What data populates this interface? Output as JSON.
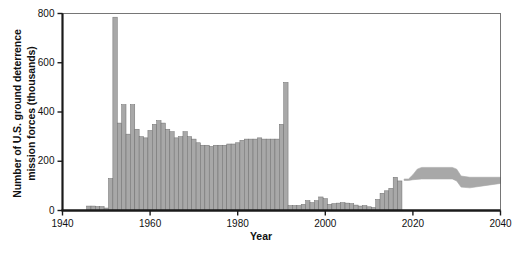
{
  "chart_data": {
    "type": "bar",
    "title": "",
    "xlabel": "Year",
    "ylabel": "Number of U.S. ground deterrence\nmission forces (thousands)",
    "xlim": [
      1940,
      2040
    ],
    "ylim": [
      0,
      800
    ],
    "xticks": [
      1940,
      1960,
      1980,
      2000,
      2020,
      2040
    ],
    "yticks": [
      0,
      200,
      400,
      600,
      800
    ],
    "grid": false,
    "legend": null,
    "bar_color": "#a8a8a8",
    "bar_edge_color": "#6e6e6e",
    "band_color": "#a8a8a8",
    "axis_color": "#1a1a1a",
    "categories": [
      1946,
      1947,
      1948,
      1949,
      1950,
      1951,
      1952,
      1953,
      1954,
      1955,
      1956,
      1957,
      1958,
      1959,
      1960,
      1961,
      1962,
      1963,
      1964,
      1965,
      1966,
      1967,
      1968,
      1969,
      1970,
      1971,
      1972,
      1973,
      1974,
      1975,
      1976,
      1977,
      1978,
      1979,
      1980,
      1981,
      1982,
      1983,
      1984,
      1985,
      1986,
      1987,
      1988,
      1989,
      1990,
      1991,
      1992,
      1993,
      1994,
      1995,
      1996,
      1997,
      1998,
      1999,
      2000,
      2001,
      2002,
      2003,
      2004,
      2005,
      2006,
      2007,
      2008,
      2009,
      2010,
      2011,
      2012,
      2013,
      2014,
      2015,
      2016,
      2017
    ],
    "values": [
      18,
      18,
      16,
      16,
      10,
      130,
      785,
      355,
      430,
      310,
      430,
      330,
      300,
      295,
      325,
      350,
      365,
      355,
      330,
      320,
      295,
      300,
      320,
      300,
      290,
      275,
      265,
      265,
      260,
      265,
      265,
      265,
      270,
      270,
      275,
      285,
      290,
      290,
      290,
      295,
      290,
      290,
      290,
      290,
      350,
      520,
      20,
      20,
      20,
      25,
      40,
      32,
      40,
      55,
      48,
      25,
      28,
      30,
      32,
      30,
      28,
      22,
      18,
      20,
      15,
      12,
      45,
      70,
      80,
      90,
      135,
      120
    ],
    "projection": {
      "label": "projection-band",
      "start_year": 2018,
      "end_year": 2040,
      "upper": [
        {
          "year": 2018,
          "value": 128
        },
        {
          "year": 2019,
          "value": 128
        },
        {
          "year": 2020,
          "value": 145
        },
        {
          "year": 2021,
          "value": 168
        },
        {
          "year": 2022,
          "value": 175
        },
        {
          "year": 2029,
          "value": 175
        },
        {
          "year": 2030,
          "value": 168
        },
        {
          "year": 2031,
          "value": 140
        },
        {
          "year": 2033,
          "value": 135
        },
        {
          "year": 2040,
          "value": 135
        }
      ],
      "lower": [
        {
          "year": 2018,
          "value": 122
        },
        {
          "year": 2019,
          "value": 122
        },
        {
          "year": 2020,
          "value": 125
        },
        {
          "year": 2022,
          "value": 128
        },
        {
          "year": 2029,
          "value": 128
        },
        {
          "year": 2030,
          "value": 120
        },
        {
          "year": 2031,
          "value": 95
        },
        {
          "year": 2033,
          "value": 92
        },
        {
          "year": 2036,
          "value": 100
        },
        {
          "year": 2040,
          "value": 110
        }
      ]
    }
  },
  "axes": {
    "y_tick_labels": [
      "0",
      "200",
      "400",
      "600",
      "800"
    ],
    "x_tick_labels": [
      "1940",
      "1960",
      "1980",
      "2000",
      "2020",
      "2040"
    ]
  }
}
